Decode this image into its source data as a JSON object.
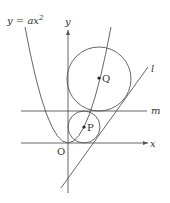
{
  "diagram": {
    "curve_label": "y = ax",
    "curve_label_exp": "2",
    "axes": {
      "x_label": "x",
      "y_label": "y",
      "origin_label": "O"
    },
    "lines": {
      "l_label": "l",
      "m_label": "m"
    },
    "points": {
      "P_label": "P",
      "Q_label": "Q"
    },
    "colors": {
      "stroke": "#555555",
      "text": "#333333",
      "background": "#ffffff"
    }
  }
}
